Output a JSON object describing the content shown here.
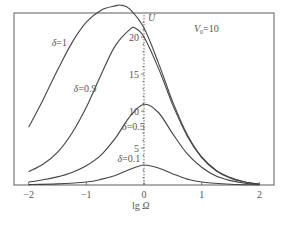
{
  "chart_data": {
    "type": "line",
    "title": "",
    "xlabel": "lg Ω",
    "ylabel": "U",
    "xlim": [
      -2.25,
      2.25
    ],
    "ylim": [
      0,
      26
    ],
    "xticks": [
      -2,
      -1,
      0,
      1,
      2
    ],
    "xtick_labels": [
      "−2",
      "−1",
      "0",
      "1",
      "2"
    ],
    "yticks": [
      5,
      10,
      15,
      20
    ],
    "ytick_labels": [
      "5",
      "10",
      "15",
      "20"
    ],
    "grid": false,
    "annotation": "V0=10",
    "series": [
      {
        "name": "δ=1",
        "x": [
          -2.0,
          -1.75,
          -1.5,
          -1.25,
          -1.0,
          -0.75,
          -0.5,
          -0.4,
          -0.25,
          0.0,
          0.25,
          0.5,
          0.75,
          1.0,
          1.25,
          1.5,
          1.75,
          2.0
        ],
        "values": [
          7.8,
          11.5,
          15.5,
          19.2,
          22.0,
          23.6,
          24.2,
          24.3,
          23.8,
          21.2,
          16.5,
          11.2,
          6.8,
          3.8,
          2.0,
          1.0,
          0.4,
          0.1
        ]
      },
      {
        "name": "δ=0.9",
        "x": [
          -2.0,
          -1.75,
          -1.5,
          -1.25,
          -1.0,
          -0.75,
          -0.5,
          -0.25,
          -0.15,
          0.0,
          0.25,
          0.5,
          0.75,
          1.0,
          1.25,
          1.5,
          1.75,
          2.0
        ],
        "values": [
          1.8,
          2.8,
          4.4,
          7.0,
          10.5,
          14.8,
          18.8,
          21.0,
          21.2,
          20.0,
          15.8,
          10.8,
          6.6,
          3.7,
          1.9,
          0.9,
          0.4,
          0.1
        ]
      },
      {
        "name": "δ=0.5",
        "x": [
          -2.0,
          -1.75,
          -1.5,
          -1.25,
          -1.0,
          -0.75,
          -0.5,
          -0.25,
          0.0,
          0.25,
          0.5,
          0.75,
          1.0,
          1.25,
          1.5,
          1.75,
          2.0
        ],
        "values": [
          0.4,
          0.7,
          1.1,
          1.7,
          2.6,
          4.0,
          6.3,
          9.2,
          10.9,
          9.8,
          6.9,
          4.2,
          2.4,
          1.2,
          0.6,
          0.25,
          0.1
        ]
      },
      {
        "name": "δ=0.1",
        "x": [
          -2.0,
          -1.5,
          -1.0,
          -0.75,
          -0.5,
          -0.25,
          0.0,
          0.25,
          0.5,
          0.75,
          1.0,
          1.5,
          2.0
        ],
        "values": [
          0.05,
          0.15,
          0.4,
          0.75,
          1.3,
          2.1,
          2.7,
          2.3,
          1.5,
          0.8,
          0.4,
          0.1,
          0.02
        ]
      }
    ],
    "curve_labels": [
      {
        "text": "δ=1",
        "x": -1.6,
        "y": 18.8
      },
      {
        "text": "δ=0.9",
        "x": -1.22,
        "y": 12.6
      },
      {
        "text": "δ=0.5",
        "x": -0.38,
        "y": 7.4
      },
      {
        "text": "δ=0.1",
        "x": -0.46,
        "y": 3.1
      }
    ]
  },
  "labels": {
    "y_axis": "U",
    "x_axis_prefix": "lg ",
    "x_axis_symbol": "Ω",
    "annotation_V": "V",
    "annotation_sub": "0",
    "annotation_rest": "=10"
  }
}
